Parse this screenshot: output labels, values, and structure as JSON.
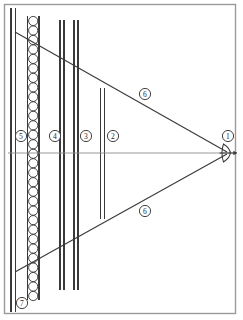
{
  "figure": {
    "background_color": "#ffffff",
    "line_color": "#3a3a3a",
    "frame_color": "#9a9a9a",
    "axis_color": "#8d8d8d",
    "label_text_color": "#2b2b2b"
  },
  "frame": {
    "x": 4,
    "y": 4,
    "width": 231,
    "height": 309
  },
  "callouts": [
    {
      "id": "callout-1",
      "label": "1",
      "cx": 228,
      "cy": 136,
      "r": 5.6,
      "target": "lens-apex"
    },
    {
      "id": "callout-2",
      "label": "2",
      "cx": 113,
      "cy": 136,
      "r": 5.6,
      "target": "vertical-line-2"
    },
    {
      "id": "callout-3",
      "label": "3",
      "cx": 86,
      "cy": 136,
      "r": 5.6,
      "target": "vertical-line-3"
    },
    {
      "id": "callout-4",
      "label": "4",
      "cx": 55,
      "cy": 136,
      "r": 5.6,
      "target": "vertical-line-4"
    },
    {
      "id": "callout-5",
      "label": "5",
      "cx": 21,
      "cy": 136,
      "r": 5.6,
      "target": "circle-column"
    },
    {
      "id": "callout-6-upper",
      "label": "6",
      "cx": 145,
      "cy": 94,
      "r": 5.6,
      "target": "upper-ray"
    },
    {
      "id": "callout-6-lower",
      "label": "6",
      "cx": 145,
      "cy": 211,
      "r": 5.6,
      "target": "lower-ray"
    },
    {
      "id": "callout-7",
      "label": "7",
      "cx": 22,
      "cy": 303,
      "r": 5.6,
      "target": "outer-wall"
    }
  ],
  "vertical_lines": [
    {
      "name": "outer-wall-left",
      "x": 11.0,
      "y1": 8,
      "y2": 312
    },
    {
      "name": "outer-wall-right",
      "x": 15.5,
      "y1": 8,
      "y2": 312
    },
    {
      "name": "circle-column-left",
      "x": 27.5,
      "y1": 16,
      "y2": 300
    },
    {
      "name": "circle-column-right",
      "x": 39.0,
      "y1": 16,
      "y2": 300
    },
    {
      "name": "vertical-line-4-left",
      "x": 60.0,
      "y1": 20,
      "y2": 290
    },
    {
      "name": "vertical-line-4-right",
      "x": 64.0,
      "y1": 20,
      "y2": 290
    },
    {
      "name": "vertical-line-3-left",
      "x": 74.0,
      "y1": 20,
      "y2": 290
    },
    {
      "name": "vertical-line-3-right",
      "x": 78.0,
      "y1": 20,
      "y2": 290
    },
    {
      "name": "vertical-line-2-left",
      "x": 100.5,
      "y1": 88,
      "y2": 219
    },
    {
      "name": "vertical-line-2-right",
      "x": 104.5,
      "y1": 88,
      "y2": 219
    }
  ],
  "circle_column": {
    "name": "stacked-circles",
    "cx": 33.2,
    "radius": 4.6,
    "top_y": 21,
    "bottom_y": 296,
    "count": 30
  },
  "axis": {
    "name": "optical-axis",
    "x1": 8,
    "y1": 153,
    "x2": 235,
    "y2": 153
  },
  "rays": [
    {
      "name": "upper-ray",
      "x1": 15,
      "y1": 32,
      "x2": 227,
      "y2": 152
    },
    {
      "name": "lower-ray",
      "x1": 15,
      "y1": 272,
      "x2": 227,
      "y2": 154
    }
  ],
  "lens": {
    "name": "lens-apex",
    "cx": 228,
    "cy": 153,
    "half_height": 9,
    "width": 9,
    "arrow_tip_x": 237
  }
}
